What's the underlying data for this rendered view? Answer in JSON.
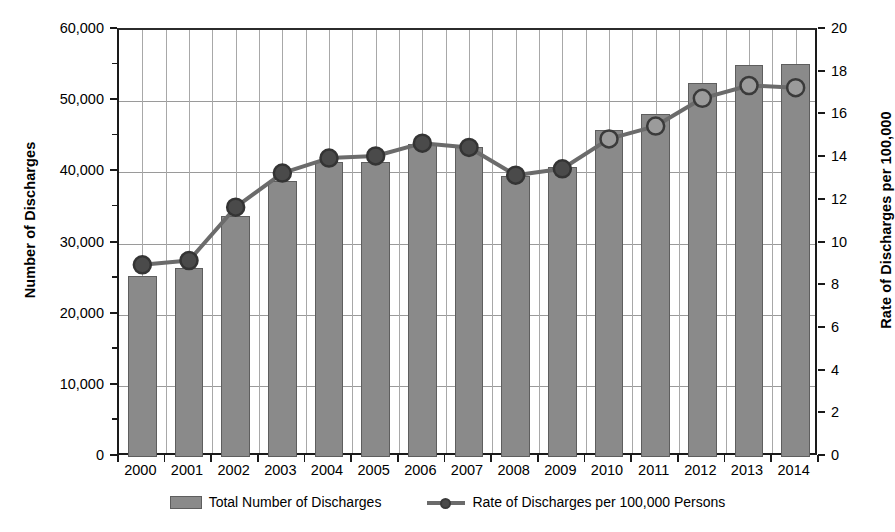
{
  "chart_data": {
    "type": "bar",
    "title": "",
    "subtitle": "",
    "xlabel": "",
    "ylabel": "Number of Discharges",
    "y2label": "Rate of Discharges per 100,000",
    "categories": [
      "2000",
      "2001",
      "2002",
      "2003",
      "2004",
      "2005",
      "2006",
      "2007",
      "2008",
      "2009",
      "2010",
      "2011",
      "2012",
      "2013",
      "2014"
    ],
    "ylim": [
      0,
      60000
    ],
    "y2lim": [
      0,
      20
    ],
    "yticks": [
      0,
      10000,
      20000,
      30000,
      40000,
      50000,
      60000
    ],
    "ytick_labels": [
      "0",
      "10,000",
      "20,000",
      "30,000",
      "40,000",
      "50,000",
      "60,000"
    ],
    "y2ticks": [
      0,
      2,
      4,
      6,
      8,
      10,
      12,
      14,
      16,
      18,
      20
    ],
    "y2tick_labels": [
      "0",
      "2",
      "4",
      "6",
      "8",
      "10",
      "12",
      "14",
      "16",
      "18",
      "20"
    ],
    "grid": true,
    "legend_position": "bottom",
    "series": [
      {
        "name": "Total Number of Discharges",
        "kind": "bar",
        "axis": "left",
        "color": "#8a8a8a",
        "values": [
          25500,
          26500,
          33800,
          38800,
          41500,
          41500,
          44000,
          43500,
          39500,
          40800,
          46000,
          48200,
          52500,
          55100,
          55200
        ]
      },
      {
        "name": "Rate of Discharges per 100,000 Persons",
        "kind": "line",
        "axis": "right",
        "color": "#6b6b6b",
        "values": [
          9.0,
          9.2,
          11.7,
          13.3,
          14.0,
          14.1,
          14.7,
          14.5,
          13.2,
          13.5,
          14.9,
          15.5,
          16.8,
          17.4,
          17.3
        ]
      }
    ]
  },
  "legend": {
    "bar_label": "Total Number of Discharges",
    "line_label": "Rate of Discharges per 100,000 Persons"
  },
  "axes": {
    "left_title": "Number of Discharges",
    "right_title": "Rate of Discharges per 100,000"
  },
  "colors": {
    "bar_fill": "#8a8a8a",
    "bar_stroke": "#5e5e5e",
    "line": "#6b6b6b",
    "marker_dark": "#4a4a4a",
    "marker_light": "#9b9b9b",
    "grid": "#9a9a9a",
    "axis": "#1a1a1a"
  }
}
